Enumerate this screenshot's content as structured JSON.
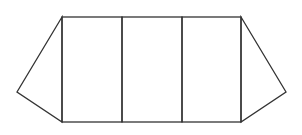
{
  "diagram": {
    "stroke_color": "#333333",
    "background": "#ffffff",
    "stroke_width": 1.3,
    "outline_points": "62,17 241,17 286,92 241,122 62,122 17,92",
    "rectangles": [
      {
        "id": "rect-1",
        "x": 62,
        "y": 17,
        "width": 60,
        "height": 105
      },
      {
        "id": "rect-2",
        "x": 122,
        "y": 17,
        "width": 60,
        "height": 105
      },
      {
        "id": "rect-3",
        "x": 182,
        "y": 17,
        "width": 59,
        "height": 105
      }
    ],
    "triangles": [
      {
        "id": "left-triangle",
        "points": "62,17 17,92 62,122"
      },
      {
        "id": "right-triangle",
        "points": "241,17 286,92 241,122"
      }
    ],
    "dividers": [
      {
        "id": "divider-1",
        "x": 62
      },
      {
        "id": "divider-2",
        "x": 122
      },
      {
        "id": "divider-3",
        "x": 182
      },
      {
        "id": "divider-4",
        "x": 241
      }
    ]
  }
}
